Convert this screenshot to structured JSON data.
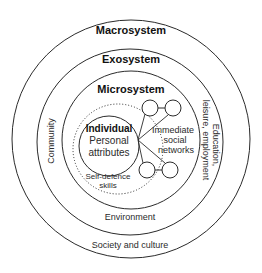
{
  "diagram": {
    "layers": {
      "macrosystem": {
        "heading": "Macrosystem",
        "label": "Society and culture"
      },
      "exosystem": {
        "heading": "Exosystem",
        "label_left": "Community",
        "label_right_line1": "Education,",
        "label_right_line2": "leisure, employment",
        "label_bottom": "Environment"
      },
      "microsystem": {
        "heading": "Microsystem",
        "networks_line1": "Immediate",
        "networks_line2": "social",
        "networks_line3": "networks"
      },
      "individual": {
        "heading": "Individual",
        "line1": "Personal",
        "line2": "attributes",
        "skills_line1": "Self-defence",
        "skills_line2": "skills"
      }
    },
    "colors": {
      "stroke": "#2b2b2b",
      "background": "#ffffff"
    }
  }
}
